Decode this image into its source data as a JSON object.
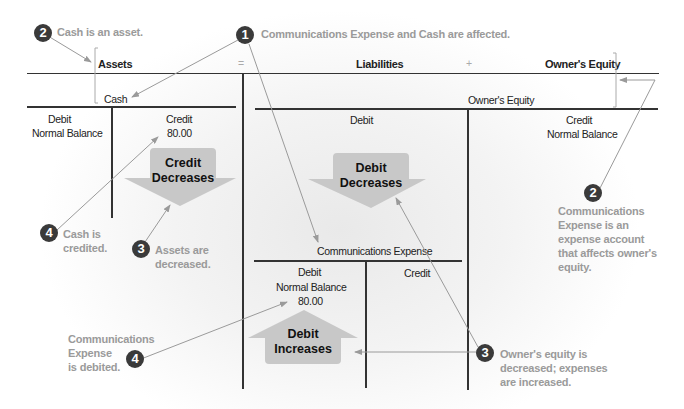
{
  "header": {
    "assets": "Assets",
    "equals": "=",
    "liabilities": "Liabilities",
    "plus": "+",
    "owners_equity": "Owner's Equity"
  },
  "cash_account": {
    "title": "Cash",
    "debit_label": "Debit",
    "debit_sub": "Normal Balance",
    "credit_label": "Credit",
    "credit_value": "80.00",
    "arrow_label_1": "Credit",
    "arrow_label_2": "Decreases"
  },
  "equity_account": {
    "title": "Owner's Equity",
    "debit_label": "Debit",
    "credit_label": "Credit",
    "credit_sub": "Normal Balance",
    "arrow_label_1": "Debit",
    "arrow_label_2": "Decreases"
  },
  "expense_account": {
    "title": "Communications Expense",
    "debit_label": "Debit",
    "debit_sub": "Normal Balance",
    "debit_value": "80.00",
    "credit_label": "Credit",
    "arrow_label_1": "Debit",
    "arrow_label_2": "Increases"
  },
  "annotations": [
    {
      "number": "1",
      "text": "Communications Expense and Cash are affected."
    },
    {
      "number": "2",
      "text": "Cash is an asset."
    },
    {
      "number": "2",
      "text": "Communications Expense is an expense account that affects owner's equity.",
      "lines": [
        "Communications",
        "Expense is an",
        "expense account",
        "that affects owner's",
        "equity."
      ]
    },
    {
      "number": "3",
      "text": "Assets are decreased.",
      "lines": [
        "Assets are",
        "decreased."
      ]
    },
    {
      "number": "3",
      "text": "Owner's equity is decreased; expenses are increased.",
      "lines": [
        "Owner's equity is",
        "decreased; expenses",
        "are increased."
      ]
    },
    {
      "number": "4",
      "text": "Cash is credited.",
      "lines": [
        "Cash is",
        "credited."
      ]
    },
    {
      "number": "4",
      "text": "Communications Expense is debited.",
      "lines": [
        "Communications",
        "Expense",
        "is debited."
      ]
    }
  ],
  "colors": {
    "line": "#333333",
    "annotation_text": "#9a9a9a",
    "badge": "#3a3a3a",
    "arrow_fill": "#c8c8c8",
    "leader": "#9a9a9a"
  }
}
